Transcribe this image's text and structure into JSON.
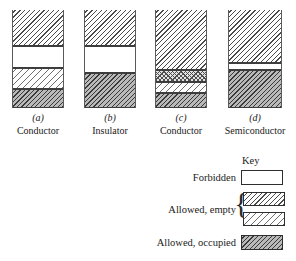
{
  "figure": {
    "columns": [
      {
        "letter": "(a)",
        "caption": "Conductor",
        "left": 12,
        "width": 52,
        "bands": [
          {
            "name": "conduction-band-empty",
            "fill": "fill-empty-a",
            "top": 0,
            "height": 36,
            "topopen": true
          },
          {
            "name": "forbidden-gap",
            "fill": "fill-forbidden",
            "top": 36,
            "height": 22,
            "topopen": false
          },
          {
            "name": "allowed-band-empty",
            "fill": "fill-empty-b",
            "top": 58,
            "height": 21,
            "topopen": false
          },
          {
            "name": "allowed-band-occupied",
            "fill": "fill-occupied",
            "top": 79,
            "height": 19,
            "topopen": false
          }
        ]
      },
      {
        "letter": "(b)",
        "caption": "Insulator",
        "left": 84,
        "width": 52,
        "bands": [
          {
            "name": "conduction-band-empty",
            "fill": "fill-empty-a",
            "top": 0,
            "height": 36,
            "topopen": true
          },
          {
            "name": "forbidden-gap",
            "fill": "fill-forbidden",
            "top": 36,
            "height": 27,
            "topopen": false
          },
          {
            "name": "valence-band-occupied",
            "fill": "fill-occupied",
            "top": 63,
            "height": 35,
            "topopen": false
          }
        ]
      },
      {
        "letter": "(c)",
        "caption": "Conductor",
        "left": 155,
        "width": 52,
        "bands": [
          {
            "name": "conduction-band-empty",
            "fill": "fill-empty-a",
            "top": 0,
            "height": 60,
            "topopen": true
          },
          {
            "name": "overlapping-bands",
            "fill": "fill-overlap",
            "top": 60,
            "height": 12,
            "topopen": false
          },
          {
            "name": "allowed-band-empty",
            "fill": "fill-empty-b",
            "top": 72,
            "height": 11,
            "topopen": false
          },
          {
            "name": "valence-band-occupied",
            "fill": "fill-occupied",
            "top": 83,
            "height": 15,
            "topopen": false
          }
        ]
      },
      {
        "letter": "(d)",
        "caption": "Semiconductor",
        "left": 228,
        "width": 54,
        "bands": [
          {
            "name": "conduction-band-empty",
            "fill": "fill-empty-a",
            "top": 0,
            "height": 53,
            "topopen": true
          },
          {
            "name": "forbidden-gap",
            "fill": "fill-forbidden",
            "top": 53,
            "height": 7,
            "topopen": false
          },
          {
            "name": "valence-band-occupied",
            "fill": "fill-occupied",
            "top": 60,
            "height": 38,
            "topopen": false
          }
        ]
      }
    ]
  },
  "legend": {
    "title": "Key",
    "entries": [
      {
        "label": "Forbidden",
        "swatch": "fill-forbidden"
      },
      {
        "label": "Allowed, empty",
        "swatch_top": "fill-empty-a",
        "swatch_bottom": "fill-empty-b"
      },
      {
        "label": "Allowed, occupied",
        "swatch": "fill-occupied"
      }
    ],
    "brace": "{"
  },
  "colors": {
    "rail": "#5a5a5a",
    "band_border": "#3d3d3d",
    "hatch_dark": "#3a3a3a",
    "hatch_light": "#6e6e6e",
    "occupied_ground": "#b9b9b9",
    "paper": "#ffffff"
  }
}
